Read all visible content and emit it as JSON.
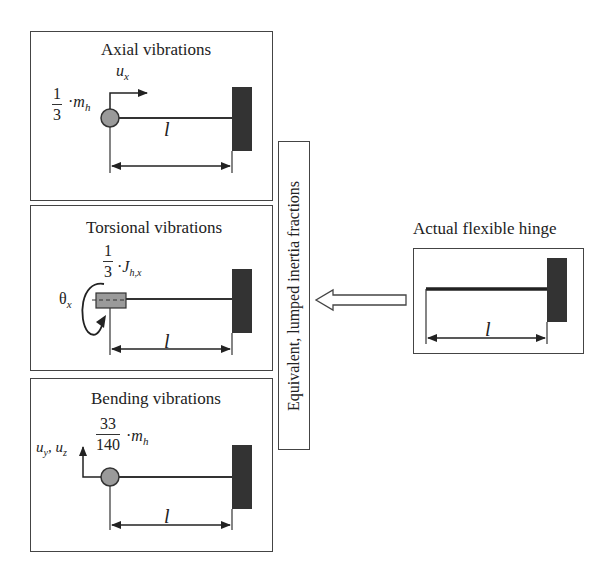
{
  "caption_fragment": "g                              g  p           g",
  "panels": [
    {
      "id": "axial",
      "title": "Axial vibrations",
      "dof_label": "u",
      "dof_sub": "x",
      "inertia_num": "1",
      "inertia_den": "3",
      "inertia_symbol": "m",
      "inertia_sub": "h",
      "length_label": "l",
      "mass_shape": "circle"
    },
    {
      "id": "torsional",
      "title": "Torsional vibrations",
      "dof_label": "θ",
      "dof_sub": "x",
      "inertia_num": "1",
      "inertia_den": "3",
      "inertia_symbol": "J",
      "inertia_sub": "h,x",
      "length_label": "l",
      "mass_shape": "rectangle"
    },
    {
      "id": "bending",
      "title": "Bending vibrations",
      "dof_label": "u",
      "dof_sub": "y",
      "dof_label2": "u",
      "dof_sub2": "z",
      "inertia_num": "33",
      "inertia_den": "140",
      "inertia_symbol": "m",
      "inertia_sub": "h",
      "length_label": "l",
      "mass_shape": "circle"
    }
  ],
  "vertical_label": "Equivalent, lumped inertia fractions",
  "actual": {
    "title": "Actual flexible hinge",
    "length_label": "l"
  },
  "colors": {
    "line": "#333333",
    "mass_fill": "#9a9a9a",
    "wall_fill": "#333333",
    "border": "#444444"
  }
}
